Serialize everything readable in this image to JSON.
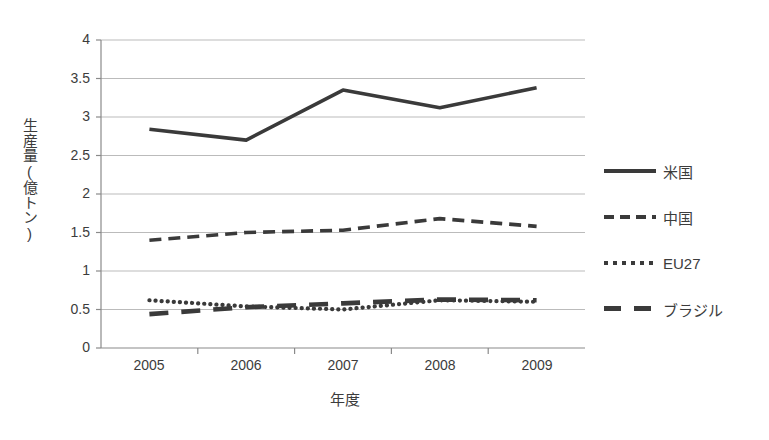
{
  "chart_data": {
    "type": "line",
    "title": "",
    "xlabel": "年度",
    "ylabel": "生産量(億トン)",
    "categories": [
      "2005",
      "2006",
      "2007",
      "2008",
      "2009"
    ],
    "x": [
      2005,
      2006,
      2007,
      2008,
      2009
    ],
    "ylim": [
      0,
      4
    ],
    "yticks": [
      "0",
      "0.5",
      "1",
      "1.5",
      "2",
      "2.5",
      "3",
      "3.5",
      "4"
    ],
    "ytick_values": [
      0,
      0.5,
      1,
      1.5,
      2,
      2.5,
      3,
      3.5,
      4
    ],
    "grid": true,
    "legend_position": "right",
    "series": [
      {
        "name": "米国",
        "style": "solid",
        "color": "#3a3a3a",
        "values": [
          2.84,
          2.7,
          3.35,
          3.12,
          3.38
        ]
      },
      {
        "name": "中国",
        "style": "dashed",
        "color": "#3a3a3a",
        "values": [
          1.4,
          1.5,
          1.53,
          1.68,
          1.58
        ]
      },
      {
        "name": "EU27",
        "style": "dotted",
        "color": "#3a3a3a",
        "values": [
          0.62,
          0.54,
          0.5,
          0.62,
          0.6
        ]
      },
      {
        "name": "ブラジル",
        "style": "long-dash",
        "color": "#3a3a3a",
        "values": [
          0.44,
          0.53,
          0.58,
          0.63,
          0.62
        ]
      }
    ]
  },
  "axes": {
    "ylabel": "生産量(億トン)",
    "xlabel": "年度",
    "yticks": [
      "4",
      "3.5",
      "3",
      "2.5",
      "2",
      "1.5",
      "1",
      "0.5",
      "0"
    ],
    "xticks": [
      "2005",
      "2006",
      "2007",
      "2008",
      "2009"
    ]
  },
  "legend": {
    "items": [
      {
        "label": "米国"
      },
      {
        "label": "中国"
      },
      {
        "label": "EU27"
      },
      {
        "label": "ブラジル"
      }
    ]
  }
}
